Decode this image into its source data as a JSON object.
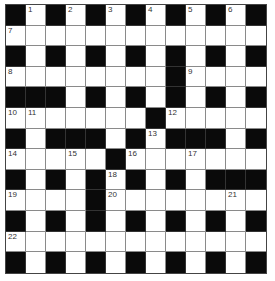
{
  "puzzle": {
    "type": "crossword",
    "rows": 13,
    "cols": 13,
    "colors": {
      "black": "#0a0a0a",
      "white": "#ffffff",
      "grid_line": "#8a8a8a"
    },
    "grid": [
      [
        "#",
        "1",
        "#",
        "2",
        "#",
        "3",
        "#",
        "4",
        "#",
        "5",
        "#",
        "6",
        "#"
      ],
      [
        "7",
        ".",
        ".",
        ".",
        ".",
        ".",
        ".",
        ".",
        ".",
        ".",
        ".",
        ".",
        "."
      ],
      [
        "#",
        ".",
        "#",
        ".",
        "#",
        ".",
        "#",
        ".",
        "#",
        ".",
        "#",
        ".",
        "#"
      ],
      [
        "8",
        ".",
        ".",
        ".",
        ".",
        ".",
        ".",
        ".",
        "#",
        "9",
        ".",
        ".",
        "."
      ],
      [
        "#",
        "#",
        "#",
        ".",
        "#",
        ".",
        "#",
        ".",
        "#",
        ".",
        "#",
        ".",
        "#"
      ],
      [
        "10",
        "11",
        ".",
        ".",
        ".",
        ".",
        ".",
        "#",
        "12",
        ".",
        ".",
        ".",
        "."
      ],
      [
        "#",
        ".",
        "#",
        "#",
        "#",
        ".",
        "#",
        "13",
        "#",
        "#",
        "#",
        ".",
        "#"
      ],
      [
        "14",
        ".",
        ".",
        "15",
        ".",
        "#",
        "16",
        ".",
        ".",
        "17",
        ".",
        ".",
        "."
      ],
      [
        "#",
        ".",
        "#",
        ".",
        "#",
        "18",
        "#",
        ".",
        "#",
        ".",
        "#",
        "#",
        "#"
      ],
      [
        "19",
        ".",
        ".",
        ".",
        "#",
        "20",
        ".",
        ".",
        ".",
        ".",
        ".",
        "21",
        "."
      ],
      [
        "#",
        ".",
        "#",
        ".",
        "#",
        ".",
        "#",
        ".",
        "#",
        ".",
        "#",
        ".",
        "#"
      ],
      [
        "22",
        ".",
        ".",
        ".",
        ".",
        ".",
        ".",
        ".",
        ".",
        ".",
        ".",
        ".",
        "."
      ],
      [
        "#",
        ".",
        "#",
        ".",
        "#",
        ".",
        "#",
        ".",
        "#",
        ".",
        "#",
        ".",
        "#"
      ]
    ],
    "clue_numbers": [
      "1",
      "2",
      "3",
      "4",
      "5",
      "6",
      "7",
      "8",
      "9",
      "10",
      "11",
      "12",
      "13",
      "14",
      "15",
      "16",
      "17",
      "18",
      "19",
      "20",
      "21",
      "22"
    ]
  }
}
